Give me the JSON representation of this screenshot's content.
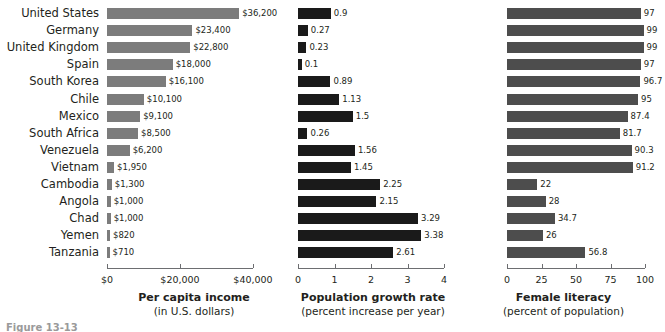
{
  "chart_data": [
    {
      "type": "bar",
      "orientation": "horizontal",
      "title": "",
      "xlabel": "Per capita income",
      "xsublabel": "(in U.S. dollars)",
      "ylabel": "",
      "xlim": [
        0,
        40000
      ],
      "grid": false,
      "legend": "none",
      "bar_color": "#7c7c7c",
      "tick_labels": [
        "$0",
        "$20,000",
        "$40,000"
      ],
      "tick_values": [
        0,
        20000,
        40000
      ],
      "categories": [
        "United States",
        "Germany",
        "United Kingdom",
        "Spain",
        "South Korea",
        "Chile",
        "Mexico",
        "South Africa",
        "Venezuela",
        "Vietnam",
        "Cambodia",
        "Angola",
        "Chad",
        "Yemen",
        "Tanzania"
      ],
      "values": [
        36200,
        23400,
        22800,
        18000,
        16100,
        10100,
        9100,
        8500,
        6200,
        1950,
        1300,
        1000,
        1000,
        820,
        710
      ],
      "value_labels": [
        "$36,200",
        "$23,400",
        "$22,800",
        "$18,000",
        "$16,100",
        "$10,100",
        "$9,100",
        "$8,500",
        "$6,200",
        "$1,950",
        "$1,300",
        "$1,000",
        "$1,000",
        "$820",
        "$710"
      ]
    },
    {
      "type": "bar",
      "orientation": "horizontal",
      "title": "",
      "xlabel": "Population growth rate",
      "xsublabel": "(percent increase per year)",
      "ylabel": "",
      "xlim": [
        0,
        4
      ],
      "grid": false,
      "legend": "none",
      "bar_color": "#1a1a1a",
      "tick_labels": [
        "0",
        "1",
        "2",
        "3",
        "4"
      ],
      "tick_values": [
        0,
        1,
        2,
        3,
        4
      ],
      "categories": [
        "United States",
        "Germany",
        "United Kingdom",
        "Spain",
        "South Korea",
        "Chile",
        "Mexico",
        "South Africa",
        "Venezuela",
        "Vietnam",
        "Cambodia",
        "Angola",
        "Chad",
        "Yemen",
        "Tanzania"
      ],
      "values": [
        0.9,
        0.27,
        0.23,
        0.1,
        0.89,
        1.13,
        1.5,
        0.26,
        1.56,
        1.45,
        2.25,
        2.15,
        3.29,
        3.38,
        2.61
      ],
      "value_labels": [
        "0.9",
        "0.27",
        "0.23",
        "0.1",
        "0.89",
        "1.13",
        "1.5",
        "0.26",
        "1.56",
        "1.45",
        "2.25",
        "2.15",
        "3.29",
        "3.38",
        "2.61"
      ]
    },
    {
      "type": "bar",
      "orientation": "horizontal",
      "title": "",
      "xlabel": "Female literacy",
      "xsublabel": "(percent of population)",
      "ylabel": "",
      "xlim": [
        0,
        100
      ],
      "grid": false,
      "legend": "none",
      "bar_color": "#4d4d4d",
      "tick_labels": [
        "0",
        "25",
        "50",
        "75",
        "100"
      ],
      "tick_values": [
        0,
        25,
        50,
        75,
        100
      ],
      "categories": [
        "United States",
        "Germany",
        "United Kingdom",
        "Spain",
        "South Korea",
        "Chile",
        "Mexico",
        "South Africa",
        "Venezuela",
        "Vietnam",
        "Cambodia",
        "Angola",
        "Chad",
        "Yemen",
        "Tanzania"
      ],
      "values": [
        97,
        99,
        99,
        97,
        96.7,
        95,
        87.4,
        81.7,
        90.3,
        91.2,
        22,
        28,
        34.7,
        26,
        56.8
      ],
      "value_labels": [
        "97",
        "99",
        "99",
        "97",
        "96.7",
        "95",
        "87.4",
        "81.7",
        "90.3",
        "91.2",
        "22",
        "28",
        "34.7",
        "26",
        "56.8"
      ]
    }
  ],
  "caption": {
    "text": "Figure 13-13"
  }
}
